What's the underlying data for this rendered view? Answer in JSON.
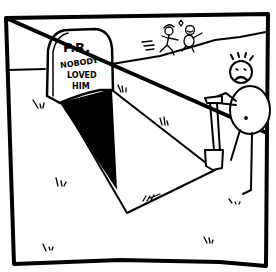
{
  "comic": {
    "panel_count": 1,
    "tombstone": {
      "line1": "P.R.",
      "line2": "NOBODY",
      "line3": "LOVED",
      "line4": "HIM"
    },
    "characters": [
      {
        "name": "sad-stick-figure-with-shovel",
        "expression": "frowning"
      },
      {
        "name": "happy-couple-running",
        "expression": "smiling"
      }
    ],
    "colors": {
      "ink": "#000000",
      "paper": "#ffffff"
    }
  }
}
